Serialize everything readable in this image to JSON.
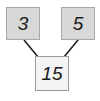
{
  "diagram": {
    "type": "factor-tree",
    "nodes": [
      {
        "id": "left",
        "value": "3",
        "fill": "#d8d8d8"
      },
      {
        "id": "right",
        "value": "5",
        "fill": "#d8d8d8"
      },
      {
        "id": "product",
        "value": "15",
        "fill": "#f4f4f4"
      }
    ],
    "edges": [
      {
        "from": "left",
        "to": "product"
      },
      {
        "from": "right",
        "to": "product"
      }
    ]
  }
}
